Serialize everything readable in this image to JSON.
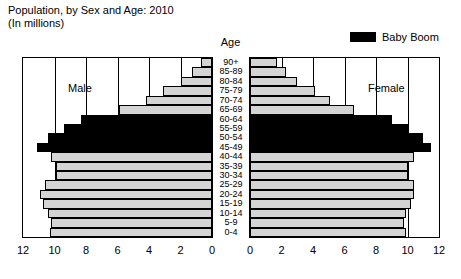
{
  "title": {
    "line1": "Population, by Sex and Age: 2010",
    "line2": "(In millions)"
  },
  "legend": {
    "label": "Baby Boom",
    "color": "#000000"
  },
  "axis_header": "Age",
  "series_names": {
    "left": "Male",
    "right": "Female"
  },
  "colors": {
    "bar_fill": "#d4d4d4",
    "baby_boom_fill": "#000000",
    "outline": "#000000"
  },
  "chart_data": {
    "type": "bar",
    "subtype": "population-pyramid",
    "title": "Population, by Sex and Age: 2010",
    "subtitle": "(In millions)",
    "xlabel": "",
    "ylabel": "Age",
    "xlim": [
      0,
      12
    ],
    "xticks": [
      0,
      2,
      4,
      6,
      8,
      10,
      12
    ],
    "left_xticks_display": [
      12,
      10,
      8,
      6,
      4,
      2,
      0
    ],
    "right_xticks_display": [
      0,
      2,
      4,
      6,
      8,
      10,
      12
    ],
    "grid": true,
    "grid_axis": "x",
    "legend_position": "top-right",
    "categories": [
      "90+",
      "85-89",
      "80-84",
      "75-79",
      "70-74",
      "65-69",
      "60-64",
      "55-59",
      "50-54",
      "45-49",
      "40-44",
      "35-39",
      "30-34",
      "25-29",
      "20-24",
      "15-19",
      "10-14",
      "5-9",
      "0-4"
    ],
    "highlight_categories": [
      "60-64",
      "55-59",
      "50-54",
      "45-49"
    ],
    "highlight_label": "Baby Boom",
    "series": [
      {
        "name": "Male",
        "direction": "left",
        "values": [
          0.7,
          1.3,
          2.0,
          3.1,
          4.2,
          5.9,
          8.3,
          9.4,
          10.4,
          11.1,
          10.2,
          9.9,
          9.9,
          10.6,
          10.9,
          10.7,
          10.4,
          10.2,
          10.3
        ]
      },
      {
        "name": "Female",
        "direction": "right",
        "values": [
          1.7,
          2.3,
          3.0,
          4.1,
          5.1,
          6.6,
          9.0,
          10.0,
          11.0,
          11.5,
          10.4,
          10.0,
          10.0,
          10.4,
          10.4,
          10.2,
          9.9,
          9.8,
          9.9
        ]
      }
    ]
  }
}
